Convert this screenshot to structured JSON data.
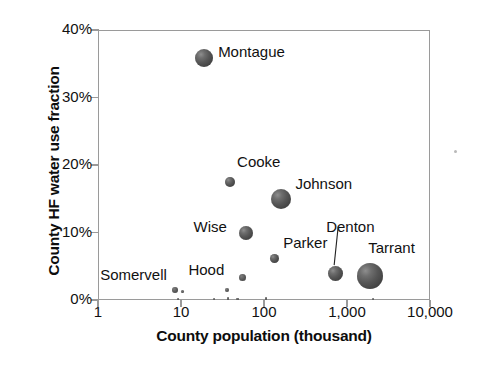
{
  "chart_data": {
    "type": "scatter",
    "title": "",
    "xlabel": "County population (thousand)",
    "ylabel": "County HF water use fraction",
    "xscale": "log",
    "xlim": [
      1,
      10000
    ],
    "ylim": [
      0,
      40
    ],
    "grid": false,
    "legend": "none",
    "bubble_size_encodes": "HF water use volume",
    "xticks": [
      "1",
      "10",
      "100",
      "1,000",
      "10,000"
    ],
    "xtick_values": [
      1,
      10,
      100,
      1000,
      10000
    ],
    "yticks": [
      "0%",
      "10%",
      "20%",
      "30%",
      "40%"
    ],
    "ytick_values": [
      0,
      10,
      20,
      30,
      40
    ],
    "points": [
      {
        "name": "Montague",
        "x": 19,
        "y": 35.8,
        "r": 9.0,
        "label_dx": 14,
        "label_dy": -7
      },
      {
        "name": "Cooke",
        "x": 39,
        "y": 17.5,
        "r": 5.0,
        "label_dx": 7,
        "label_dy": -21
      },
      {
        "name": "Johnson",
        "x": 162,
        "y": 14.9,
        "r": 10.0,
        "label_dx": 14,
        "label_dy": -16
      },
      {
        "name": "Wise",
        "x": 60,
        "y": 9.9,
        "r": 7.0,
        "label_dx": -52,
        "label_dy": -7
      },
      {
        "name": "Parker",
        "x": 133,
        "y": 6.2,
        "r": 4.5,
        "label_dx": 9,
        "label_dy": -16
      },
      {
        "name": "Hood",
        "x": 55,
        "y": 3.3,
        "r": 3.5,
        "label_dx": -54,
        "label_dy": -9
      },
      {
        "name": "Denton",
        "x": 720,
        "y": 3.9,
        "r": 7.5,
        "label_dx": -9,
        "label_dy": -48,
        "leader": true
      },
      {
        "name": "Tarrant",
        "x": 1900,
        "y": 3.6,
        "r": 13.0,
        "label_dx": -2,
        "label_dy": -29
      },
      {
        "name": "Somervell",
        "x": 8.5,
        "y": 1.5,
        "r": 3.0,
        "label_dx": -75,
        "label_dy": -16
      }
    ],
    "minor_points": [
      {
        "x": 10.5,
        "y": 1.2,
        "r": 1.6
      },
      {
        "x": 36,
        "y": 1.5,
        "r": 2.0
      },
      {
        "x": 9.2,
        "y": 0.15,
        "r": 1.1
      },
      {
        "x": 25,
        "y": 0.15,
        "r": 1.1
      },
      {
        "x": 37,
        "y": 0.25,
        "r": 1.3
      },
      {
        "x": 48,
        "y": 0.15,
        "r": 1.1
      },
      {
        "x": 105,
        "y": 0.2,
        "r": 1.2
      },
      {
        "x": 2050,
        "y": 0.15,
        "r": 1.1
      }
    ]
  },
  "colors": {
    "bubble_fill": "#565656",
    "bubble_highlight": "#8e8e8e",
    "axis_line": "#9a9a9a",
    "text": "#111111",
    "background": "#ffffff"
  },
  "artifacts": [
    {
      "x": 455,
      "y": 151,
      "r": 1.5
    }
  ]
}
